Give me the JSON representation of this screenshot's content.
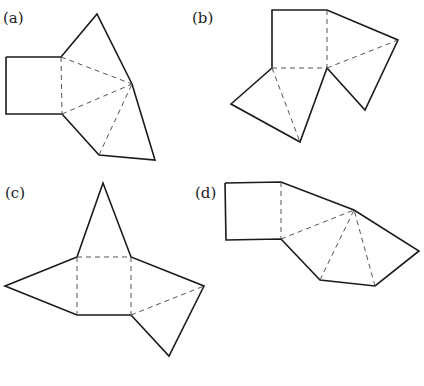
{
  "figures": [
    {
      "label": "(a)",
      "label_pos": [
        3,
        23
      ],
      "outline": "6,57 61,57 97,14 132,84 155,160 99,155 62,114 6,114 6,57",
      "folds": [
        [
          61,
          57,
          62,
          114
        ],
        [
          61,
          57,
          132,
          84
        ],
        [
          62,
          114,
          132,
          84
        ],
        [
          99,
          155,
          132,
          84
        ]
      ]
    },
    {
      "label": "(b)",
      "label_pos": [
        192,
        23
      ],
      "outline": "272,68 272,10 327,10 398,40 365,110 327,68 300,142 231,104 272,68",
      "folds": [
        [
          327,
          10,
          327,
          68
        ],
        [
          272,
          68,
          327,
          68
        ],
        [
          327,
          68,
          398,
          40
        ],
        [
          272,
          68,
          300,
          142
        ]
      ]
    },
    {
      "label": "(c)",
      "label_pos": [
        5,
        198
      ],
      "outline": "77,257 103,183 131,257 204,286 169,356 131,315 77,315 5,286 77,257",
      "folds": [
        [
          77,
          257,
          131,
          257
        ],
        [
          77,
          257,
          77,
          315
        ],
        [
          131,
          257,
          131,
          315
        ],
        [
          131,
          315,
          204,
          286
        ]
      ]
    },
    {
      "label": "(d)",
      "label_pos": [
        195,
        198
      ],
      "outline": "225,183 281,182 354,210 419,251 375,286 320,280 281,239 226,240 225,183",
      "folds": [
        [
          281,
          182,
          281,
          239
        ],
        [
          281,
          239,
          354,
          210
        ],
        [
          320,
          280,
          354,
          210
        ],
        [
          375,
          286,
          354,
          210
        ]
      ]
    }
  ],
  "labels": {
    "a": "(a)",
    "b": "(b)",
    "c": "(c)",
    "d": "(d)"
  }
}
